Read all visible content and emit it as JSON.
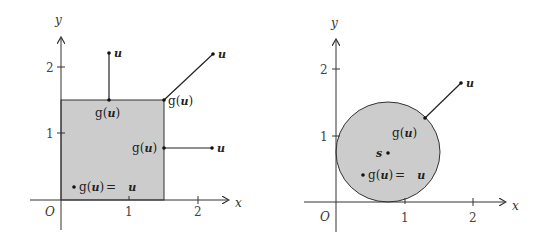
{
  "figures": [
    {
      "id": "square",
      "region": "square [0,1.5]x[0,1.5]",
      "axes": {
        "x_label": "x",
        "y_label": "y",
        "origin_label": "O",
        "x_ticks": [
          "1",
          "2"
        ],
        "y_ticks": [
          "1",
          "2"
        ]
      },
      "labels": {
        "u": "u",
        "g": "g",
        "open_paren": "(",
        "close_paren": ")",
        "equals": "=",
        "inside_eq": "g(u) =",
        "inside_u": "u"
      },
      "projections": [
        {
          "name": "top-edge",
          "u": [
            0.7,
            2.2
          ],
          "g_u": [
            0.7,
            1.5
          ]
        },
        {
          "name": "corner",
          "u": [
            2.2,
            2.2
          ],
          "g_u": [
            1.5,
            1.5
          ]
        },
        {
          "name": "right-edge",
          "u": [
            2.2,
            0.8
          ],
          "g_u": [
            1.5,
            0.8
          ]
        },
        {
          "name": "interior",
          "u": [
            0.2,
            0.2
          ],
          "g_u": [
            0.2,
            0.2
          ]
        }
      ]
    },
    {
      "id": "disk",
      "region": "disk centered at s",
      "axes": {
        "x_label": "x",
        "y_label": "y",
        "origin_label": "O",
        "x_ticks": [
          "1",
          "2"
        ],
        "y_ticks": [
          "1",
          "2"
        ]
      },
      "labels": {
        "u": "u",
        "s": "s",
        "g": "g",
        "open_paren": "(",
        "close_paren": ")",
        "inside_eq": "g(u) =",
        "inside_u": "u"
      },
      "center_s": [
        0.75,
        0.75
      ],
      "radius": 0.75,
      "projections": [
        {
          "name": "outside",
          "u": [
            1.85,
            1.75
          ],
          "g_u": [
            1.3,
            1.25
          ]
        },
        {
          "name": "interior",
          "u": [
            0.4,
            0.4
          ],
          "g_u": [
            0.4,
            0.4
          ]
        }
      ]
    }
  ],
  "colors": {
    "fill": "#cccccc",
    "stroke": "#333333",
    "axis": "#333333"
  }
}
